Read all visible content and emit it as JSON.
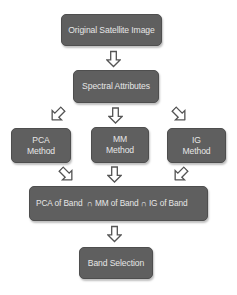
{
  "diagram": {
    "type": "flowchart",
    "colors": {
      "box_fill": "#5f5f5f",
      "box_text": "#e6e6e6",
      "arrow_stroke": "#555555",
      "background": "#ffffff"
    },
    "nodes": {
      "original_image": {
        "label": "Original Satellite Image"
      },
      "spectral": {
        "label": "Spectral Attributes"
      },
      "pca": {
        "line1": "PCA",
        "line2": "Method"
      },
      "mm": {
        "line1": "MM",
        "line2": "Method"
      },
      "ig": {
        "line1": "IG",
        "line2": "Method"
      },
      "intersection": {
        "label": "PCA of Band  ∩ MM of Band ∩ IG of Band"
      },
      "band_selection": {
        "label": "Band Selection"
      }
    },
    "edges": [
      {
        "from": "original_image",
        "to": "spectral",
        "arrow": "down-outline-arrow"
      },
      {
        "from": "spectral",
        "to": "pca",
        "arrow": "down-left-outline-arrow"
      },
      {
        "from": "spectral",
        "to": "mm",
        "arrow": "down-outline-arrow"
      },
      {
        "from": "spectral",
        "to": "ig",
        "arrow": "down-right-outline-arrow"
      },
      {
        "from": "pca",
        "to": "intersection",
        "arrow": "down-right-outline-arrow"
      },
      {
        "from": "mm",
        "to": "intersection",
        "arrow": "down-outline-arrow"
      },
      {
        "from": "ig",
        "to": "intersection",
        "arrow": "down-left-outline-arrow"
      },
      {
        "from": "intersection",
        "to": "band_selection",
        "arrow": "down-outline-arrow"
      }
    ]
  }
}
